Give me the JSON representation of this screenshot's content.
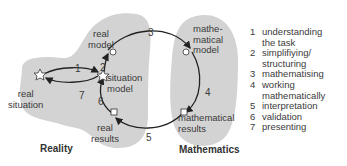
{
  "diagram": {
    "colors": {
      "region": "#d3d3d3",
      "line": "#222222",
      "text": "#3a3a3a"
    },
    "regions": [
      {
        "id": "reality",
        "label": "Reality"
      },
      {
        "id": "mathematics",
        "label": "Mathematics"
      }
    ],
    "nodes": [
      {
        "id": "real_situation",
        "label": "real\nsituation",
        "shape": "star"
      },
      {
        "id": "situation_model",
        "label": "situation\nmodel",
        "shape": "star"
      },
      {
        "id": "real_model",
        "label": "real\nmodel",
        "shape": "circle"
      },
      {
        "id": "mathematical_model",
        "label": "mathe-\nmatical\nmodel",
        "shape": "circle"
      },
      {
        "id": "mathematical_results",
        "label": "mathematical\nresults",
        "shape": "square"
      },
      {
        "id": "real_results",
        "label": "real\nresults",
        "shape": "square"
      }
    ],
    "edge_numbers": [
      "1",
      "2",
      "3",
      "4",
      "5",
      "6",
      "7"
    ],
    "legend": [
      {
        "n": "1",
        "text": "understanding\nthe task"
      },
      {
        "n": "2",
        "text": "simplifiying/\nstructuring"
      },
      {
        "n": "3",
        "text": "mathematising"
      },
      {
        "n": "4",
        "text": "working\nmathematically"
      },
      {
        "n": "5",
        "text": "interpretation"
      },
      {
        "n": "6",
        "text": "validation"
      },
      {
        "n": "7",
        "text": "presenting"
      }
    ]
  }
}
